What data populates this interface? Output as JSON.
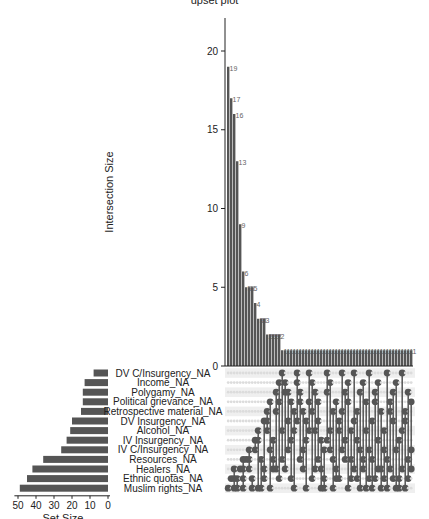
{
  "title": "upset plot",
  "chart_data": {
    "type": "upset",
    "title": "",
    "intersection_axis": {
      "label": "Intersection Size",
      "ticks": [
        0,
        5,
        10,
        15,
        20
      ],
      "ylim": [
        0,
        22
      ]
    },
    "set_size_axis": {
      "label": "Set Size",
      "ticks": [
        50,
        40,
        30,
        20,
        10,
        0
      ]
    },
    "sets": [
      {
        "name": "DV C/Insurgency_NA",
        "size": 8
      },
      {
        "name": "Income_NA",
        "size": 13
      },
      {
        "name": "Polygamy_NA",
        "size": 14
      },
      {
        "name": "Political grievance_NA",
        "size": 14
      },
      {
        "name": "Retrospective material_NA",
        "size": 15
      },
      {
        "name": "DV Insurgency_NA",
        "size": 20
      },
      {
        "name": "Alcohol_NA",
        "size": 21
      },
      {
        "name": "IV Insurgency_NA",
        "size": 23
      },
      {
        "name": "IV C/Insurgency_NA",
        "size": 26
      },
      {
        "name": "Resources_NA",
        "size": 36
      },
      {
        "name": "Healers_NA",
        "size": 42
      },
      {
        "name": "Ethnic quotas_NA",
        "size": 45
      },
      {
        "name": "Muslim rights_NA",
        "size": 49
      }
    ],
    "intersection_sizes": [
      19,
      17,
      16,
      13,
      9,
      6,
      5,
      5,
      5,
      4,
      3,
      3,
      3,
      2,
      2,
      2,
      2,
      2,
      1,
      1,
      1,
      1,
      1,
      1,
      1,
      1,
      1,
      1,
      1,
      1,
      1,
      1,
      1,
      1,
      1,
      1,
      1,
      1,
      1,
      1,
      1,
      1,
      1,
      1,
      1,
      1,
      1,
      1,
      1,
      1,
      1,
      1,
      1,
      1,
      1,
      1,
      1,
      1,
      1,
      1,
      1,
      1
    ],
    "intersection_members": [
      [
        12
      ],
      [
        11
      ],
      [
        10,
        11,
        12
      ],
      [
        12,
        11
      ],
      [
        10
      ],
      [
        9,
        10,
        11,
        12
      ],
      [
        9
      ],
      [
        8,
        9,
        10
      ],
      [
        11,
        12
      ],
      [
        7,
        8
      ],
      [
        6,
        7,
        12
      ],
      [
        9,
        12
      ],
      [
        5,
        10,
        11
      ],
      [
        4,
        5,
        6
      ],
      [
        3,
        8,
        12
      ],
      [
        7,
        9,
        10
      ],
      [
        2,
        4,
        10
      ],
      [
        1,
        3,
        11
      ],
      [
        0,
        6,
        9
      ],
      [
        1,
        2,
        10
      ],
      [
        2,
        5,
        8
      ],
      [
        3,
        7,
        11
      ],
      [
        4,
        6,
        12
      ],
      [
        0,
        1,
        5
      ],
      [
        2,
        3,
        9
      ],
      [
        4,
        8,
        10
      ],
      [
        5,
        7,
        12
      ],
      [
        0,
        3,
        6
      ],
      [
        1,
        4,
        11
      ],
      [
        2,
        6,
        10
      ],
      [
        3,
        5,
        9
      ],
      [
        7,
        10,
        12
      ],
      [
        8,
        11,
        12
      ],
      [
        0,
        2,
        7
      ],
      [
        1,
        6,
        8
      ],
      [
        4,
        9,
        12
      ],
      [
        3,
        10,
        11
      ],
      [
        5,
        6,
        11
      ],
      [
        0,
        4,
        8
      ],
      [
        2,
        7,
        9
      ],
      [
        1,
        3,
        12
      ],
      [
        6,
        9,
        11
      ],
      [
        0,
        5,
        10
      ],
      [
        4,
        7,
        11
      ],
      [
        2,
        8,
        12
      ],
      [
        1,
        9,
        10
      ],
      [
        3,
        6,
        12
      ],
      [
        0,
        8,
        11
      ],
      [
        5,
        9,
        12
      ],
      [
        2,
        3,
        11
      ],
      [
        1,
        7,
        10
      ],
      [
        4,
        10,
        12
      ],
      [
        6,
        8,
        11
      ],
      [
        0,
        9,
        12
      ],
      [
        3,
        4,
        10
      ],
      [
        2,
        5,
        11
      ],
      [
        1,
        8,
        12
      ],
      [
        7,
        11,
        12
      ],
      [
        0,
        6,
        10
      ],
      [
        4,
        5,
        12
      ],
      [
        2,
        9,
        11
      ],
      [
        3,
        8,
        10
      ]
    ],
    "bar_labels_visible": true,
    "grid": false,
    "colors": {
      "bar": "#555555",
      "dot_on": "#555555",
      "dot_off": "#dcdcdc",
      "stripe": "#efefef",
      "axis": "#222222"
    }
  }
}
